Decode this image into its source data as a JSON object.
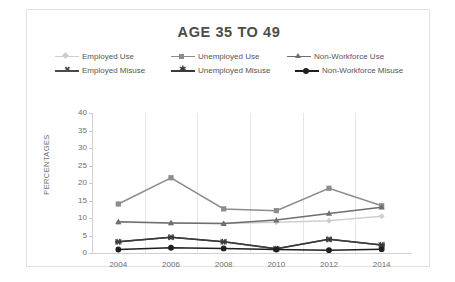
{
  "chart_data": {
    "type": "line",
    "title": "AGE 35 TO 49",
    "xlabel": "",
    "ylabel": "PERCENTAGES",
    "categories": [
      "2004",
      "2006",
      "2008",
      "2010",
      "2012",
      "2014"
    ],
    "x": [
      2004,
      2006,
      2008,
      2010,
      2012,
      2014
    ],
    "ylim": [
      0,
      40
    ],
    "ytick_labels": [
      "0",
      "5",
      "10",
      "15",
      "20",
      "25",
      "30",
      "35",
      "40"
    ],
    "ytick_values": [
      0,
      5,
      10,
      15,
      20,
      25,
      30,
      35,
      40
    ],
    "grid": "vertical",
    "legend_position": "top",
    "series": [
      {
        "name": "Employed Use",
        "marker": "diamond",
        "color": "#cfcfcf",
        "values": [
          8.8,
          8.6,
          8.4,
          8.8,
          9.2,
          10.5
        ]
      },
      {
        "name": "Unemployed Use",
        "marker": "square",
        "color": "#8c8c8c",
        "values": [
          14.0,
          21.5,
          12.6,
          12.1,
          18.5,
          13.5
        ]
      },
      {
        "name": "Non-Workforce Use",
        "marker": "triangle",
        "color": "#6e6e6e",
        "values": [
          8.9,
          8.6,
          8.4,
          9.4,
          11.3,
          13.1
        ]
      },
      {
        "name": "Employed Misuse",
        "marker": "bowtie",
        "color": "#4a4a4a",
        "values": [
          3.2,
          4.5,
          3.2,
          1.2,
          3.9,
          2.3
        ]
      },
      {
        "name": "Unemployed Misuse",
        "marker": "asterisk",
        "color": "#3a3a3a",
        "values": [
          3.2,
          4.5,
          3.2,
          1.2,
          3.9,
          2.3
        ]
      },
      {
        "name": "Non-Workforce Misuse",
        "marker": "circle",
        "color": "#1f1f1f",
        "values": [
          1.0,
          1.5,
          1.3,
          1.0,
          0.8,
          1.1
        ]
      }
    ]
  },
  "chart": {
    "title": "AGE 35 TO 49",
    "y_axis_title": "PERCENTAGES"
  },
  "legend": {
    "rows": [
      [
        {
          "label": "Employed Use"
        },
        {
          "label": "Unemployed Use"
        },
        {
          "label": "Non-Workforce Use"
        }
      ],
      [
        {
          "label": "Employed Misuse"
        },
        {
          "label": "Unemployed Misuse"
        },
        {
          "label": "Non-Workforce Misuse"
        }
      ]
    ]
  }
}
